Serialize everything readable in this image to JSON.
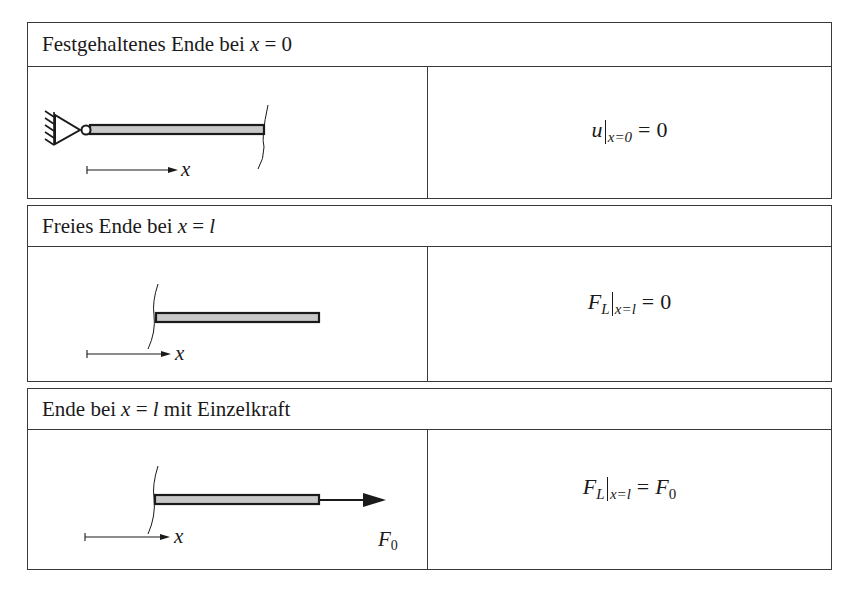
{
  "page": {
    "background": "#ffffff",
    "line_color": "#3a3a3a",
    "bar_fill": "#c8c8c8"
  },
  "panels": [
    {
      "id": "fixed-end",
      "header": {
        "text": "Festgehaltenes Ende bei ",
        "math_var": "x",
        "math_rel": " = ",
        "math_val": "0",
        "suffix": ""
      },
      "diagram": {
        "support": "fixed-hinge-support",
        "axis_label": "x",
        "force_label": ""
      },
      "formula": {
        "symbol": "u",
        "symbol_sub": "",
        "eval_sub": "x=0",
        "eq": "=",
        "rhs": "0",
        "rhs_sub": ""
      }
    },
    {
      "id": "free-end",
      "header": {
        "text": "Freies Ende bei ",
        "math_var": "x",
        "math_rel": " = ",
        "math_val": "l",
        "suffix": ""
      },
      "diagram": {
        "support": "none",
        "axis_label": "x",
        "force_label": ""
      },
      "formula": {
        "symbol": "F",
        "symbol_sub": "L",
        "eval_sub": "x=l",
        "eq": "=",
        "rhs": "0",
        "rhs_sub": ""
      }
    },
    {
      "id": "end-with-point-force",
      "header": {
        "text": "Ende bei ",
        "math_var": "x",
        "math_rel": " = ",
        "math_val": "l",
        "suffix": " mit Einzelkraft"
      },
      "diagram": {
        "support": "none",
        "axis_label": "x",
        "force_label": "F",
        "force_label_sub": "0"
      },
      "formula": {
        "symbol": "F",
        "symbol_sub": "L",
        "eval_sub": "x=l",
        "eq": "=",
        "rhs": "F",
        "rhs_sub": "0"
      }
    }
  ]
}
